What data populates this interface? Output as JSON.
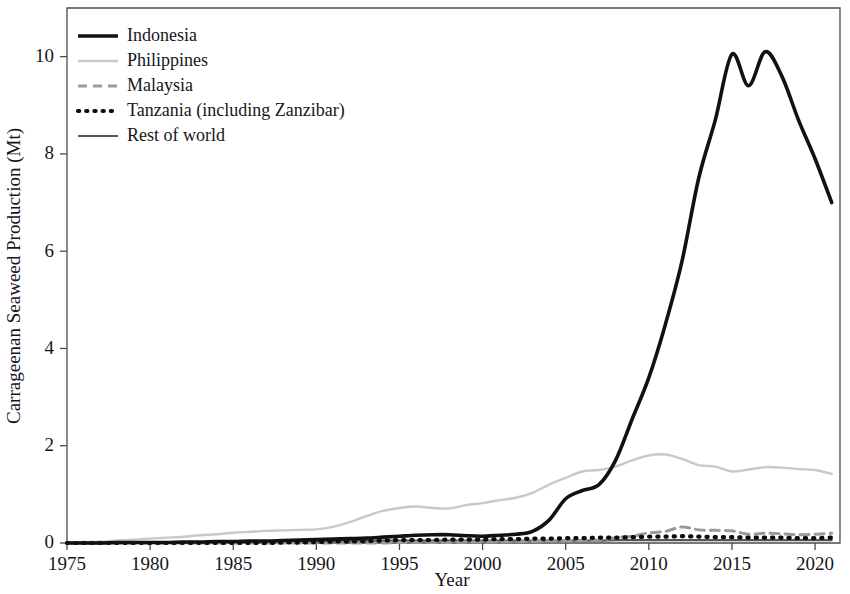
{
  "chart_data": {
    "type": "line",
    "title": "",
    "xlabel": "Year",
    "ylabel": "Carrageenan Seaweed Production (Mt)",
    "xlim": [
      1975,
      2021.5
    ],
    "ylim": [
      0,
      11.0
    ],
    "grid": false,
    "legend_position": "top-left",
    "xticks": [
      1975,
      1980,
      1985,
      1990,
      1995,
      2000,
      2005,
      2010,
      2015,
      2020
    ],
    "xtick_labels": [
      "1975",
      "1980",
      "1985",
      "1990",
      "1995",
      "2000",
      "2005",
      "2010",
      "2015",
      "2020"
    ],
    "yticks": [
      0,
      2,
      4,
      6,
      8,
      10
    ],
    "ytick_labels": [
      "0",
      "2",
      "4",
      "6",
      "8",
      "10"
    ],
    "x": [
      1975,
      1976,
      1977,
      1978,
      1979,
      1980,
      1981,
      1982,
      1983,
      1984,
      1985,
      1986,
      1987,
      1988,
      1989,
      1990,
      1991,
      1992,
      1993,
      1994,
      1995,
      1996,
      1997,
      1998,
      1999,
      2000,
      2001,
      2002,
      2003,
      2004,
      2005,
      2006,
      2007,
      2008,
      2009,
      2010,
      2011,
      2012,
      2013,
      2014,
      2015,
      2016,
      2017,
      2018,
      2019,
      2020,
      2021
    ],
    "series": [
      {
        "name": "Indonesia",
        "color": "#111111",
        "width": 3.6,
        "dash": "none",
        "values": [
          0.0,
          0.0,
          0.0,
          0.01,
          0.01,
          0.01,
          0.01,
          0.02,
          0.02,
          0.03,
          0.03,
          0.04,
          0.04,
          0.05,
          0.06,
          0.07,
          0.08,
          0.09,
          0.1,
          0.12,
          0.14,
          0.16,
          0.17,
          0.17,
          0.15,
          0.14,
          0.16,
          0.18,
          0.24,
          0.47,
          0.91,
          1.08,
          1.2,
          1.7,
          2.55,
          3.4,
          4.5,
          5.8,
          7.5,
          8.7,
          10.05,
          9.4,
          10.1,
          9.6,
          8.7,
          7.9,
          7.0
        ]
      },
      {
        "name": "Philippines",
        "color": "#c9c9c9",
        "width": 2.4,
        "dash": "none",
        "values": [
          0.01,
          0.02,
          0.03,
          0.05,
          0.07,
          0.09,
          0.11,
          0.13,
          0.16,
          0.18,
          0.21,
          0.23,
          0.25,
          0.26,
          0.27,
          0.28,
          0.33,
          0.43,
          0.55,
          0.66,
          0.72,
          0.75,
          0.72,
          0.71,
          0.78,
          0.82,
          0.88,
          0.93,
          1.03,
          1.2,
          1.34,
          1.47,
          1.5,
          1.57,
          1.7,
          1.8,
          1.82,
          1.73,
          1.6,
          1.57,
          1.47,
          1.51,
          1.56,
          1.55,
          1.52,
          1.5,
          1.42
        ]
      },
      {
        "name": "Malaysia",
        "color": "#9a9a9a",
        "width": 3.0,
        "dash": "9,6",
        "values": [
          0.0,
          0.0,
          0.0,
          0.0,
          0.0,
          0.0,
          0.0,
          0.0,
          0.0,
          0.0,
          0.0,
          0.0,
          0.0,
          0.0,
          0.0,
          0.0,
          0.0,
          0.0,
          0.0,
          0.0,
          0.01,
          0.01,
          0.01,
          0.01,
          0.02,
          0.02,
          0.02,
          0.03,
          0.03,
          0.04,
          0.04,
          0.05,
          0.06,
          0.11,
          0.14,
          0.21,
          0.24,
          0.33,
          0.27,
          0.26,
          0.25,
          0.18,
          0.2,
          0.19,
          0.17,
          0.18,
          0.2
        ]
      },
      {
        "name": "Tanzania (including Zanzibar)",
        "color": "#0d0d0d",
        "width": 4.2,
        "dash": "1.2,7",
        "values": [
          0.0,
          0.0,
          0.0,
          0.0,
          0.0,
          0.0,
          0.0,
          0.0,
          0.0,
          0.0,
          0.0,
          0.0,
          0.0,
          0.01,
          0.01,
          0.02,
          0.03,
          0.03,
          0.04,
          0.05,
          0.06,
          0.06,
          0.06,
          0.07,
          0.07,
          0.07,
          0.08,
          0.08,
          0.09,
          0.09,
          0.1,
          0.1,
          0.11,
          0.11,
          0.12,
          0.13,
          0.13,
          0.14,
          0.13,
          0.12,
          0.12,
          0.11,
          0.11,
          0.11,
          0.1,
          0.1,
          0.11
        ]
      },
      {
        "name": "Rest of world",
        "color": "#555560",
        "width": 2.2,
        "dash": "none",
        "values": [
          0.01,
          0.01,
          0.01,
          0.01,
          0.02,
          0.02,
          0.02,
          0.02,
          0.02,
          0.02,
          0.03,
          0.03,
          0.03,
          0.03,
          0.03,
          0.04,
          0.04,
          0.04,
          0.04,
          0.05,
          0.05,
          0.05,
          0.05,
          0.05,
          0.05,
          0.05,
          0.05,
          0.05,
          0.05,
          0.05,
          0.05,
          0.05,
          0.05,
          0.06,
          0.06,
          0.06,
          0.06,
          0.06,
          0.06,
          0.06,
          0.06,
          0.06,
          0.06,
          0.06,
          0.06,
          0.06,
          0.06
        ]
      }
    ],
    "legend_entries": [
      {
        "label": "Indonesia",
        "color": "#111111",
        "width": 3.6,
        "dash": "none"
      },
      {
        "label": "Philippines",
        "color": "#c9c9c9",
        "width": 2.4,
        "dash": "none"
      },
      {
        "label": "Malaysia",
        "color": "#9a9a9a",
        "width": 3.0,
        "dash": "9,6"
      },
      {
        "label": "Tanzania (including Zanzibar)",
        "color": "#0d0d0d",
        "width": 4.2,
        "dash": "1.2,7"
      },
      {
        "label": "Rest of world",
        "color": "#555560",
        "width": 2.2,
        "dash": "none"
      }
    ]
  }
}
